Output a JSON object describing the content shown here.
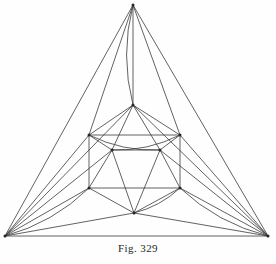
{
  "figure": {
    "caption": "Fig. 329",
    "title": "Fig. 329",
    "colors": {
      "ink": "#3a3a3a",
      "ink_dark": "#262626",
      "background": "#fefefe",
      "caption_color": "#231f1c"
    },
    "stroke_width": 0.8,
    "canvas": {
      "width": 276,
      "height": 264
    }
  },
  "chart_data": {
    "type": "diagram",
    "title": "Fig. 329",
    "vertices": [
      {
        "id": "apex",
        "label": "top apex",
        "x": 133,
        "y": 5
      },
      {
        "id": "bl",
        "label": "bottom left corner",
        "x": 5,
        "y": 236
      },
      {
        "id": "br",
        "label": "bottom right corner",
        "x": 268,
        "y": 236
      },
      {
        "id": "tm",
        "label": "upper middle",
        "x": 133,
        "y": 105
      },
      {
        "id": "sq_tl",
        "label": "square top left",
        "x": 89,
        "y": 135
      },
      {
        "id": "sq_tr",
        "label": "square top right",
        "x": 180,
        "y": 135
      },
      {
        "id": "sq_bl",
        "label": "square bottom left",
        "x": 89,
        "y": 188
      },
      {
        "id": "sq_br",
        "label": "square bottom right",
        "x": 180,
        "y": 188
      },
      {
        "id": "in_l",
        "label": "inner left",
        "x": 112,
        "y": 150
      },
      {
        "id": "in_r",
        "label": "inner right",
        "x": 160,
        "y": 150
      },
      {
        "id": "bm",
        "label": "bottom middle",
        "x": 134,
        "y": 213
      }
    ],
    "straight_edges": [
      [
        "apex",
        "bl"
      ],
      [
        "apex",
        "br"
      ],
      [
        "bl",
        "br"
      ],
      [
        "apex",
        "tm"
      ],
      [
        "apex",
        "sq_tl"
      ],
      [
        "apex",
        "sq_tr"
      ],
      [
        "tm",
        "sq_tl"
      ],
      [
        "tm",
        "sq_tr"
      ],
      [
        "tm",
        "in_l"
      ],
      [
        "tm",
        "in_r"
      ],
      [
        "sq_tl",
        "sq_tr"
      ],
      [
        "sq_tl",
        "sq_bl"
      ],
      [
        "sq_tr",
        "sq_br"
      ],
      [
        "sq_bl",
        "sq_br"
      ],
      [
        "sq_tl",
        "in_l"
      ],
      [
        "sq_tr",
        "in_r"
      ],
      [
        "in_l",
        "in_r"
      ],
      [
        "in_l",
        "sq_bl"
      ],
      [
        "in_r",
        "sq_br"
      ],
      [
        "in_l",
        "bm"
      ],
      [
        "in_r",
        "bm"
      ],
      [
        "sq_bl",
        "bm"
      ],
      [
        "sq_br",
        "bm"
      ],
      [
        "bl",
        "sq_tl"
      ],
      [
        "br",
        "sq_tr"
      ],
      [
        "bl",
        "sq_bl"
      ],
      [
        "br",
        "sq_br"
      ],
      [
        "bl",
        "bm"
      ],
      [
        "br",
        "bm"
      ],
      [
        "bl",
        "in_l"
      ],
      [
        "br",
        "in_r"
      ],
      [
        "bl",
        "tm"
      ],
      [
        "br",
        "tm"
      ]
    ],
    "arc_edges": [
      {
        "from": "apex",
        "to": "tm",
        "bulge": "left",
        "note": "curve bulging left of the vertical axis"
      },
      {
        "from": "sq_tl",
        "to": "in_r",
        "bulge": "down",
        "note": "arc across upper square region"
      },
      {
        "from": "sq_tr",
        "to": "in_l",
        "bulge": "down",
        "note": "arc across upper square region"
      },
      {
        "from": "sq_br",
        "to": "bm",
        "bulge": "right",
        "note": "small arc at bottom centre"
      },
      {
        "from": "bl",
        "to": "sq_bl",
        "bulge": "down",
        "note": "sweeping arc to lower left"
      },
      {
        "from": "br",
        "to": "sq_br",
        "bulge": "down",
        "note": "sweeping arc to lower right"
      }
    ],
    "counts": {
      "vertices": 11,
      "straight_edges": 33,
      "arc_edges": 6
    },
    "xlabel": "",
    "ylabel": "",
    "grid": false,
    "legend": false
  }
}
